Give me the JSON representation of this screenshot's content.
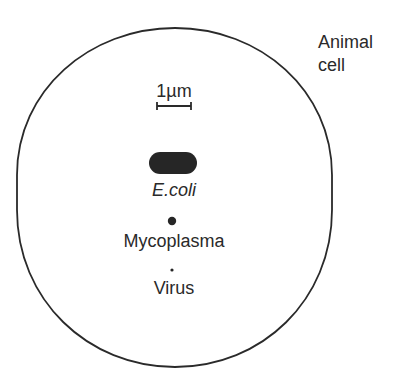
{
  "diagram": {
    "cell_label_line1": "Animal",
    "cell_label_line2": "cell",
    "scale_label": "1µm",
    "items": [
      {
        "name": "E.coli",
        "shape": "rounded-rod"
      },
      {
        "name": "Mycoplasma",
        "shape": "dot"
      },
      {
        "name": "Virus",
        "shape": "small-dot"
      }
    ],
    "colors": {
      "outline": "#2a2a2a",
      "fill": "#262626",
      "background": "#ffffff"
    }
  }
}
